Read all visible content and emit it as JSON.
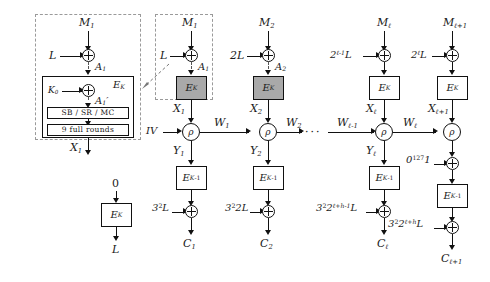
{
  "figure": {
    "type": "cryptographic-block-diagram"
  },
  "expansion_box": {
    "name": "E_K internal expansion (dashed callout)",
    "message_label": "M",
    "message_sub": "1",
    "offset_label": "L",
    "xor_out_label": "A",
    "xor_out_sub": "1",
    "cipher_label": "E",
    "cipher_sub": "K",
    "subkey_label": "K",
    "subkey_sub": "0",
    "inner_xor_out_label": "A",
    "inner_xor_out_sub": "1",
    "inner_xor_out_prime": "′",
    "round_op_label": "SB / SR / MC",
    "rounds_label": "9 full rounds",
    "output_label": "X",
    "output_sub": "1"
  },
  "l_generation": {
    "input_label": "0",
    "cipher_label": "E",
    "cipher_sub": "K",
    "output_label": "L"
  },
  "iv": {
    "label": "IV"
  },
  "final_constant": {
    "label": "0",
    "sup": "127",
    "tail": "1"
  },
  "ellipsis": "···",
  "rho_label": "ρ",
  "columns": [
    {
      "id": "col-1",
      "message": "M",
      "message_sub": "1",
      "offset_in": "L",
      "offset_in_sup": "",
      "a_label": "A",
      "a_sub": "1",
      "cipher": "E",
      "cipher_sub": "K",
      "cipher_shaded": true,
      "x_label": "X",
      "x_sub": "1",
      "w_out": "W",
      "w_out_sub": "1",
      "y_label": "Y",
      "y_sub": "1",
      "decipher": "E",
      "decipher_sub": "K",
      "decipher_sup": "-1",
      "offset_out": "3",
      "offset_out_sup": "2",
      "offset_out_tail": "L",
      "cipher_text": "C",
      "cipher_text_sub": "1"
    },
    {
      "id": "col-2",
      "message": "M",
      "message_sub": "2",
      "offset_in": "2L",
      "offset_in_sup": "",
      "a_label": "A",
      "a_sub": "2",
      "cipher": "E",
      "cipher_sub": "K",
      "cipher_shaded": true,
      "x_label": "X",
      "x_sub": "2",
      "w_out": "W",
      "w_out_sub": "2",
      "y_label": "Y",
      "y_sub": "2",
      "decipher": "E",
      "decipher_sub": "K",
      "decipher_sup": "-1",
      "offset_out": "3",
      "offset_out_sup": "2",
      "offset_out_tail": "2L",
      "cipher_text": "C",
      "cipher_text_sub": "2"
    },
    {
      "id": "col-ell",
      "message": "M",
      "message_sub": "ℓ",
      "offset_in": "2",
      "offset_in_sup": "ℓ-1",
      "offset_in_tail": "L",
      "a_label": "",
      "a_sub": "",
      "cipher": "E",
      "cipher_sub": "K",
      "cipher_shaded": false,
      "x_label": "X",
      "x_sub": "ℓ",
      "w_in": "W",
      "w_in_sub": "ℓ-1",
      "w_out": "W",
      "w_out_sub": "ℓ",
      "y_label": "Y",
      "y_sub": "ℓ",
      "decipher": "E",
      "decipher_sub": "K",
      "decipher_sup": "-1",
      "offset_out": "3",
      "offset_out_sup": "2",
      "offset_out_mid": "2",
      "offset_out_mid_sup": "ℓ+h-1",
      "offset_out_tail": "L",
      "cipher_text": "C",
      "cipher_text_sub": "ℓ"
    },
    {
      "id": "col-ell-plus-1",
      "message": "M",
      "message_sub": "ℓ+1",
      "offset_in": "2",
      "offset_in_sup": "ℓ",
      "offset_in_tail": "L",
      "a_label": "",
      "a_sub": "",
      "cipher": "E",
      "cipher_sub": "K",
      "cipher_shaded": false,
      "x_label": "X",
      "x_sub": "ℓ+1",
      "w_out": "",
      "w_out_sub": "",
      "y_label": "",
      "y_sub": "",
      "decipher": "E",
      "decipher_sub": "K",
      "decipher_sup": "-1",
      "offset_out": "3",
      "offset_out_sup": "2",
      "offset_out_mid": "2",
      "offset_out_mid_sup": "ℓ+h",
      "offset_out_tail": "L",
      "cipher_text": "C",
      "cipher_text_sub": "ℓ+1"
    }
  ]
}
